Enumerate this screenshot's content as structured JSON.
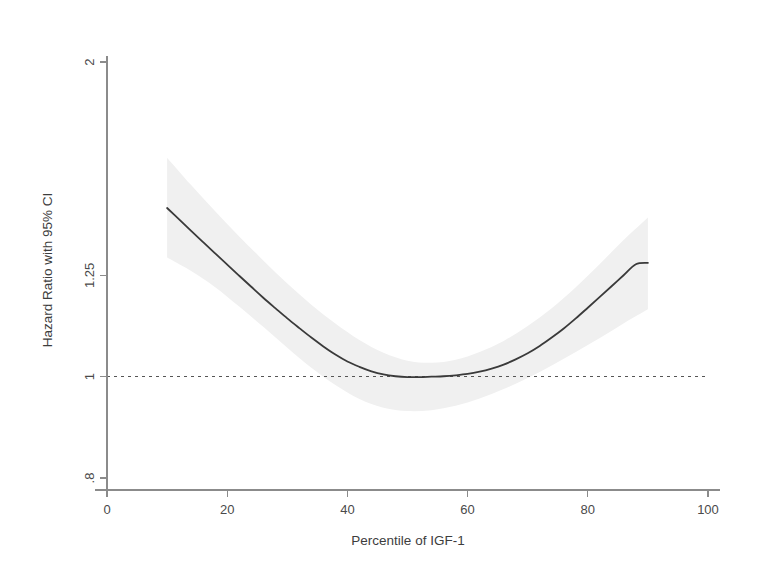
{
  "figure": {
    "background_color": "#ffffff",
    "width": 764,
    "height": 576
  },
  "chart_data": {
    "type": "line",
    "title": "",
    "subtitle": "",
    "xlabel": "Percentile of IGF-1",
    "ylabel": "Hazard Ratio with 95% CI",
    "yscale": "log",
    "xlim": [
      0,
      100
    ],
    "ylim": [
      0.8,
      2
    ],
    "grid": false,
    "legend": "none",
    "xticks": [
      0,
      20,
      40,
      60,
      80,
      100
    ],
    "xtick_labels": [
      "0",
      "20",
      "40",
      "60",
      "80",
      "100"
    ],
    "yticks": [
      0.8,
      1,
      1.25,
      2
    ],
    "ytick_labels": [
      ".8",
      "1",
      "1.25",
      "2"
    ],
    "reference_line": {
      "y": 1,
      "style": "dashed",
      "color": "#555555",
      "x_start": 0,
      "x_end": 100
    },
    "curve_color": "#3a3a3a",
    "band_color": "#f0f0f0",
    "series": [
      {
        "name": "Hazard Ratio",
        "x": [
          10,
          12,
          14,
          16,
          18,
          20,
          22,
          24,
          26,
          28,
          30,
          32,
          34,
          36,
          38,
          40,
          42,
          44,
          46,
          48,
          50,
          52,
          54,
          56,
          58,
          60,
          62,
          64,
          66,
          68,
          70,
          72,
          74,
          76,
          78,
          80,
          82,
          84,
          86,
          88,
          90
        ],
        "values": [
          1.45,
          1.414,
          1.379,
          1.345,
          1.312,
          1.28,
          1.249,
          1.219,
          1.19,
          1.163,
          1.137,
          1.113,
          1.09,
          1.069,
          1.05,
          1.034,
          1.022,
          1.012,
          1.005,
          1.001,
          0.999,
          0.999,
          1.0,
          1.001,
          1.003,
          1.006,
          1.011,
          1.018,
          1.027,
          1.039,
          1.053,
          1.07,
          1.09,
          1.112,
          1.137,
          1.164,
          1.192,
          1.221,
          1.251,
          1.281,
          1.285
        ]
      },
      {
        "name": "95% CI upper",
        "x": [
          10,
          14,
          18,
          22,
          26,
          30,
          34,
          38,
          42,
          46,
          50,
          54,
          58,
          62,
          66,
          70,
          74,
          78,
          82,
          86,
          90
        ],
        "values": [
          1.62,
          1.525,
          1.44,
          1.362,
          1.292,
          1.228,
          1.172,
          1.124,
          1.084,
          1.054,
          1.036,
          1.031,
          1.038,
          1.056,
          1.082,
          1.118,
          1.163,
          1.218,
          1.282,
          1.352,
          1.42
        ]
      },
      {
        "name": "95% CI lower",
        "x": [
          10,
          14,
          18,
          22,
          26,
          30,
          34,
          38,
          42,
          46,
          50,
          54,
          58,
          62,
          66,
          70,
          74,
          78,
          82,
          86,
          90
        ],
        "values": [
          1.3,
          1.262,
          1.218,
          1.167,
          1.116,
          1.066,
          1.02,
          0.982,
          0.952,
          0.934,
          0.927,
          0.929,
          0.938,
          0.953,
          0.973,
          0.997,
          1.025,
          1.056,
          1.089,
          1.125,
          1.16
        ]
      }
    ],
    "annotations": []
  },
  "axes_geometry": {
    "x_px_min": 107,
    "x_px_max": 708,
    "y_px_at_0_8": 478,
    "y_px_at_2": 62
  }
}
